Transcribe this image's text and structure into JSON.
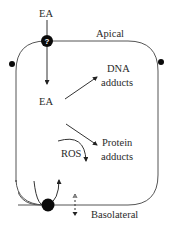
{
  "diagram": {
    "type": "cell-transport-schematic",
    "labels": {
      "ea_extracellular": "EA",
      "apical": "Apical",
      "ea_intracellular": "EA",
      "dna_adducts_line1": "DNA",
      "dna_adducts_line2": "adducts",
      "protein_adducts_line1": "Protein",
      "protein_adducts_line2": "adducts",
      "ros": "ROS",
      "basolateral": "Basolateral",
      "apical_transporter_symbol": "?"
    },
    "nodes": [
      {
        "id": "apical-transporter",
        "shape": "filled-circle",
        "label": "?"
      },
      {
        "id": "left-junction",
        "shape": "filled-circle"
      },
      {
        "id": "right-junction",
        "shape": "filled-circle"
      },
      {
        "id": "basolateral-transporter",
        "shape": "filled-circle"
      }
    ],
    "edges": [
      {
        "from": "EA (extracellular)",
        "to": "EA (intracellular)",
        "via": "apical-transporter",
        "style": "solid-arrow"
      },
      {
        "from": "EA (intracellular)",
        "to": "DNA adducts",
        "style": "solid-arrow"
      },
      {
        "from": "EA (intracellular)",
        "to": "Protein adducts",
        "style": "solid-arrow"
      },
      {
        "from": "ROS",
        "to": "Protein adducts",
        "style": "curved-arrow"
      },
      {
        "from": "basolateral-transporter",
        "to": "cell interior",
        "style": "U-curved-arrow"
      },
      {
        "from": "basolateral membrane",
        "to": "outside",
        "style": "dashed-bidirectional-arrow"
      }
    ],
    "colors": {
      "line": "#333333",
      "membrane": "#555555",
      "node_fill": "#0a0a0a",
      "background": "#ffffff"
    }
  }
}
